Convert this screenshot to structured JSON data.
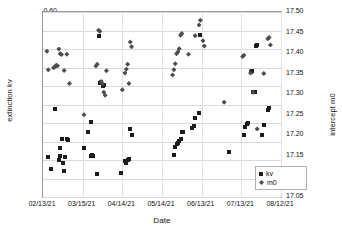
{
  "chart_data": {
    "type": "scatter",
    "title": "",
    "xlabel": "Date",
    "ylabel": "extinction kv",
    "y2label": "intercept m0",
    "grid": true,
    "legend_position": "bottom-right",
    "xlim": [
      "02/13/21",
      "08/12/21"
    ],
    "xticks": [
      "02/13/21",
      "03/15/21",
      "04/14/21",
      "05/14/21",
      "06/13/21",
      "07/13/21",
      "08/12/21"
    ],
    "ylim": [
      0.1,
      0.6
    ],
    "yticks": [
      "0.10",
      "0.15",
      "0.20",
      "0.25",
      "0.30",
      "0.35",
      "0.40",
      "0.45",
      "0.50",
      "0.55",
      "0.60"
    ],
    "y2lim": [
      17.05,
      17.5
    ],
    "y2ticks": [
      "17.05",
      "17.10",
      "17.15",
      "17.20",
      "17.25",
      "17.30",
      "17.35",
      "17.40",
      "17.45",
      "17.50"
    ],
    "series": [
      {
        "name": "kv",
        "axis": "left",
        "marker": "square",
        "color": "#1c1c1c",
        "points": [
          [
            6,
            0.176
          ],
          [
            4,
            0.209
          ],
          [
            9,
            0.339
          ],
          [
            12,
            0.199
          ],
          [
            13,
            0.212
          ],
          [
            13,
            0.232
          ],
          [
            14,
            0.257
          ],
          [
            15,
            0.191
          ],
          [
            16,
            0.17
          ],
          [
            17,
            0.208
          ],
          [
            18,
            0.257
          ],
          [
            19,
            0.255
          ],
          [
            31,
            0.232
          ],
          [
            34,
            0.275
          ],
          [
            36,
            0.304
          ],
          [
            36,
            0.211
          ],
          [
            37,
            0.214
          ],
          [
            38,
            0.21
          ],
          [
            41,
            0.162
          ],
          [
            42,
            0.536
          ],
          [
            43,
            0.408
          ],
          [
            44,
            0.41
          ],
          [
            45,
            0.401
          ],
          [
            46,
            0.403
          ],
          [
            59,
            0.165
          ],
          [
            62,
            0.196
          ],
          [
            63,
            0.191
          ],
          [
            64,
            0.2
          ],
          [
            65,
            0.204
          ],
          [
            66,
            0.284
          ],
          [
            67,
            0.267
          ],
          [
            99,
            0.214
          ],
          [
            100,
            0.235
          ],
          [
            101,
            0.243
          ],
          [
            102,
            0.247
          ],
          [
            103,
            0.252
          ],
          [
            104,
            0.258
          ],
          [
            105,
            0.277
          ],
          [
            106,
            0.276
          ],
          [
            113,
            0.287
          ],
          [
            114,
            0.292
          ],
          [
            115,
            0.313
          ],
          [
            118,
            0.327
          ],
          [
            119,
            0.537
          ],
          [
            141,
            0.222
          ],
          [
            152,
            0.268
          ],
          [
            153,
            0.29
          ],
          [
            154,
            0.297
          ],
          [
            155,
            0.3
          ],
          [
            157,
            0.437
          ],
          [
            158,
            0.44
          ],
          [
            159,
            0.383
          ],
          [
            160,
            0.385
          ],
          [
            161,
            0.508
          ],
          [
            162,
            0.51
          ],
          [
            166,
            0.268
          ],
          [
            167,
            0.295
          ],
          [
            170,
            0.336
          ],
          [
            171,
            0.34
          ]
        ]
      },
      {
        "name": "m0",
        "axis": "right",
        "marker": "diamond",
        "color": "#4d4d4d",
        "points": [
          [
            3,
            0.494
          ],
          [
            4,
            0.444
          ],
          [
            8,
            0.449
          ],
          [
            9,
            0.452
          ],
          [
            10,
            0.456
          ],
          [
            11,
            0.455
          ],
          [
            12,
            0.5
          ],
          [
            13,
            0.487
          ],
          [
            14,
            0.485
          ],
          [
            16,
            0.442
          ],
          [
            18,
            0.486
          ],
          [
            20,
            0.407
          ],
          [
            31,
            0.322
          ],
          [
            40,
            0.454
          ],
          [
            41,
            0.459
          ],
          [
            42,
            0.551
          ],
          [
            43,
            0.548
          ],
          [
            44,
            0.412
          ],
          [
            45,
            0.406
          ],
          [
            46,
            0.383
          ],
          [
            47,
            0.375
          ],
          [
            48,
            0.441
          ],
          [
            60,
            0.39
          ],
          [
            62,
            0.435
          ],
          [
            63,
            0.445
          ],
          [
            64,
            0.459
          ],
          [
            65,
            0.407
          ],
          [
            66,
            0.519
          ],
          [
            67,
            0.506
          ],
          [
            98,
            0.43
          ],
          [
            99,
            0.444
          ],
          [
            100,
            0.46
          ],
          [
            101,
            0.487
          ],
          [
            102,
            0.492
          ],
          [
            103,
            0.501
          ],
          [
            104,
            0.537
          ],
          [
            105,
            0.542
          ],
          [
            110,
            0.486
          ],
          [
            115,
            0.536
          ],
          [
            118,
            0.565
          ],
          [
            119,
            0.578
          ],
          [
            121,
            0.522
          ],
          [
            122,
            0.508
          ],
          [
            137,
            0.356
          ],
          [
            151,
            0.48
          ],
          [
            152,
            0.483
          ],
          [
            157,
            0.435
          ],
          [
            159,
            0.383
          ],
          [
            162,
            0.284
          ],
          [
            167,
            0.434
          ],
          [
            170,
            0.528
          ],
          [
            171,
            0.531
          ],
          [
            172,
            0.511
          ]
        ]
      }
    ]
  },
  "legend": {
    "entries": [
      {
        "label": "kv",
        "marker": "square"
      },
      {
        "label": "m0",
        "marker": "diamond"
      }
    ]
  }
}
